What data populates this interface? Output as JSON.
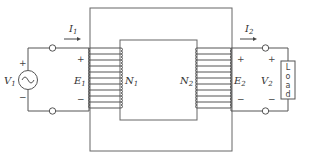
{
  "diagram": {
    "type": "transformer-circuit",
    "primary": {
      "source_label": "V",
      "source_sub": "1",
      "current_label": "I",
      "current_sub": "1",
      "emf_label": "E",
      "emf_sub": "1",
      "turns_label": "N",
      "turns_sub": "1",
      "plus": "+",
      "minus": "−"
    },
    "secondary": {
      "voltage_label": "V",
      "voltage_sub": "2",
      "current_label": "I",
      "current_sub": "2",
      "emf_label": "E",
      "emf_sub": "2",
      "turns_label": "N",
      "turns_sub": "2",
      "plus": "+",
      "minus": "−",
      "load_chars": [
        "L",
        "o",
        "a",
        "d"
      ]
    },
    "colors": {
      "line": "#555555",
      "text": "#333333",
      "background": "#ffffff"
    }
  }
}
